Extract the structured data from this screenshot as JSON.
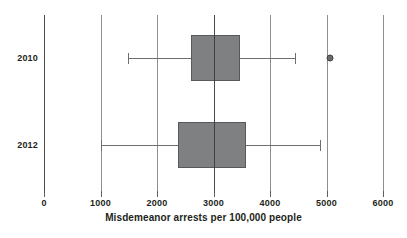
{
  "chart_data": {
    "type": "box",
    "title": "",
    "xlabel": "Misdemeanor arrests per 100,000 people",
    "ylabel": "",
    "xlim": [
      0,
      6000
    ],
    "xticks": [
      0,
      1000,
      2000,
      3000,
      4000,
      5000,
      6000
    ],
    "xtick_labels": [
      "0",
      "1000",
      "2000",
      "3000",
      "4000",
      "5000",
      "6000"
    ],
    "grid": true,
    "orientation": "horizontal",
    "legend": "none",
    "categories": [
      "2010",
      "2012"
    ],
    "boxes": [
      {
        "label": "2010",
        "whisker_low": 1490,
        "q1": 2600,
        "median": 3000,
        "q3": 3470,
        "whisker_high": 4440,
        "outliers": [
          5060
        ]
      },
      {
        "label": "2012",
        "whisker_low": 1000,
        "q1": 2370,
        "median": 3000,
        "q3": 3575,
        "whisker_high": 4880,
        "outliers": []
      }
    ]
  },
  "colors": {
    "box_fill": "#7f8082",
    "box_border": "#58595b",
    "whisker": "#6d6e70",
    "median": "#3f4042",
    "gridline": "#8f9092",
    "gridline_emphasis": "#4a4a4c",
    "outlier_fill": "#6a6b6d",
    "text": "#231f20",
    "background": "#ffffff"
  }
}
